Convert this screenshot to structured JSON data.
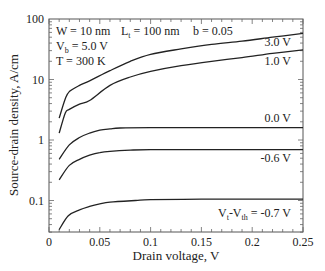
{
  "chart_data": {
    "type": "line",
    "title": "",
    "xlabel": "Drain voltage, V",
    "ylabel": "Source-drain density, A/cm",
    "xscale": "linear",
    "yscale": "log",
    "xlim": [
      0,
      0.25
    ],
    "ylim": [
      0.03,
      100
    ],
    "xticks": [
      0,
      0.05,
      0.1,
      0.15,
      0.2,
      0.25
    ],
    "xtick_labels": [
      "0",
      "0.05",
      "0.1",
      "0.15",
      "0.2",
      "0.25"
    ],
    "yticks": [
      0.1,
      1,
      10,
      100
    ],
    "ytick_labels": [
      "0.1",
      "1",
      "10",
      "100"
    ],
    "grid": false,
    "legend": "inline labels at right",
    "annotations": {
      "w": "W = 10 nm",
      "lt_main": "L",
      "lt_sub": "t",
      "lt_rest": " = 100 nm",
      "b": "b = 0.05",
      "vb_main": "V",
      "vb_sub": "b",
      "vb_rest": " = 5.0 V",
      "t": "T = 300 K"
    },
    "series": [
      {
        "name": "3.0 V",
        "label": "3.0 V",
        "x": [
          0.01,
          0.016,
          0.02,
          0.03,
          0.04,
          0.06,
          0.08,
          0.1,
          0.13,
          0.16,
          0.19,
          0.22,
          0.25
        ],
        "values": [
          2.3,
          4.8,
          6.3,
          8.0,
          9.5,
          14,
          20,
          26,
          32,
          38,
          43,
          50,
          58
        ]
      },
      {
        "name": "1.0 V",
        "label": "1.0 V",
        "x": [
          0.01,
          0.016,
          0.02,
          0.03,
          0.04,
          0.06,
          0.08,
          0.1,
          0.13,
          0.16,
          0.19,
          0.22,
          0.25
        ],
        "values": [
          1.3,
          2.8,
          3.2,
          3.9,
          4.5,
          8,
          11,
          13.6,
          17,
          20,
          23,
          27,
          31
        ]
      },
      {
        "name": "0.0 V",
        "label": "0.0 V",
        "x": [
          0.01,
          0.02,
          0.03,
          0.04,
          0.05,
          0.06,
          0.07,
          0.1,
          0.15,
          0.2,
          0.25
        ],
        "values": [
          0.48,
          0.83,
          1.1,
          1.3,
          1.45,
          1.53,
          1.58,
          1.6,
          1.6,
          1.6,
          1.6
        ]
      },
      {
        "name": "-0.6 V",
        "label": "-0.6 V",
        "x": [
          0.01,
          0.02,
          0.03,
          0.04,
          0.05,
          0.06,
          0.08,
          0.1,
          0.15,
          0.2,
          0.25
        ],
        "values": [
          0.22,
          0.38,
          0.48,
          0.56,
          0.62,
          0.65,
          0.68,
          0.69,
          0.69,
          0.69,
          0.69
        ]
      },
      {
        "name": "Vt-Vth = -0.7 V",
        "label_main": "V",
        "label_sub1": "t",
        "label_mid": "-V",
        "label_sub2": "th",
        "label_rest": " = -0.7 V",
        "x": [
          0.01,
          0.019,
          0.03,
          0.04,
          0.05,
          0.06,
          0.085,
          0.1,
          0.15,
          0.2,
          0.25
        ],
        "values": [
          0.033,
          0.056,
          0.07,
          0.08,
          0.088,
          0.094,
          0.1,
          0.103,
          0.105,
          0.105,
          0.105
        ]
      }
    ]
  }
}
